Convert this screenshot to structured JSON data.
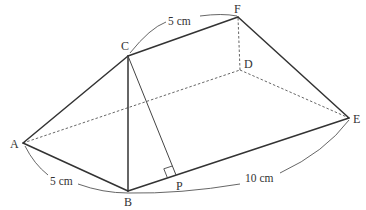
{
  "figure": {
    "type": "triangular-prism",
    "vertices": {
      "A": {
        "label": "A",
        "x": 23,
        "y": 143
      },
      "B": {
        "label": "B",
        "x": 128,
        "y": 191
      },
      "C": {
        "label": "C",
        "x": 128,
        "y": 56
      },
      "D": {
        "label": "D",
        "x": 240,
        "y": 70
      },
      "E": {
        "label": "E",
        "x": 349,
        "y": 118
      },
      "F": {
        "label": "F",
        "x": 238,
        "y": 17
      },
      "P": {
        "label": "P",
        "x": 176,
        "y": 175
      }
    },
    "solid_edges": [
      "AB",
      "AC",
      "BC",
      "CF",
      "FE",
      "BE"
    ],
    "dashed_edges": [
      "AD",
      "DF",
      "DE"
    ],
    "thin_edges": [
      "CP"
    ],
    "right_angle_at": "P",
    "dimensions": {
      "CF": "5 cm",
      "AB": "5 cm",
      "BE": "10 cm"
    }
  }
}
